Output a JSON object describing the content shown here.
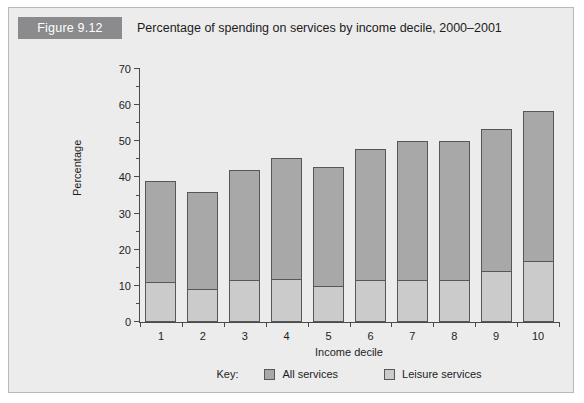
{
  "figure": {
    "badge": "Figure 9.12",
    "caption": "Percentage of spending on services by income decile, 2000–2001",
    "badge_color": "#8b8b8d",
    "panel_background": "#ececed"
  },
  "legend": {
    "key_label": "Key:",
    "entries": [
      {
        "label": "All services",
        "color": "#a8a8a8"
      },
      {
        "label": "Leisure services",
        "color": "#cbcbcb"
      }
    ]
  },
  "chart_data": {
    "type": "bar",
    "title": "Percentage of spending on services by income decile, 2000–2001",
    "xlabel": "Income decile",
    "ylabel": "Percentage",
    "categories": [
      "1",
      "2",
      "3",
      "4",
      "5",
      "6",
      "7",
      "8",
      "9",
      "10"
    ],
    "series": [
      {
        "name": "All services",
        "color": "#a8a8a8",
        "values": [
          39,
          36,
          42,
          45.5,
          43,
          48,
          50,
          50,
          53.5,
          58.5
        ]
      },
      {
        "name": "Leisure services",
        "color": "#cbcbcb",
        "values": [
          11,
          9,
          11.5,
          12,
          10,
          11.5,
          11.5,
          11.5,
          14,
          17
        ]
      }
    ],
    "stacked": "overlay",
    "ylim": [
      0,
      70
    ],
    "ytick_step": 10,
    "yticks": [
      0,
      10,
      20,
      30,
      40,
      50,
      60,
      70
    ],
    "yticks_minor": [
      5,
      15,
      25,
      35,
      45,
      55,
      65
    ],
    "grid": false,
    "legend_position": "bottom"
  }
}
